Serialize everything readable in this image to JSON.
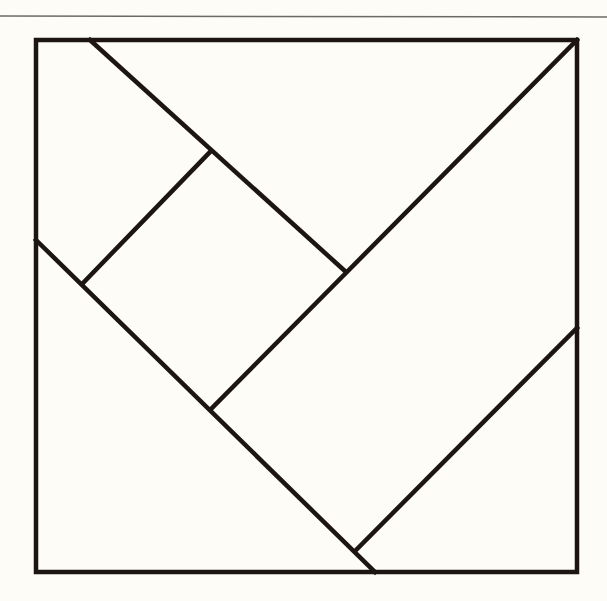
{
  "diagram": {
    "type": "tangram-square-dissection",
    "background_color": "#fdfcf7",
    "stroke_color": "#1c1511",
    "rule_color": "#6b6b66",
    "top_rule": {
      "x1": 0,
      "y1": 16,
      "x2": 607,
      "y2": 17
    },
    "outer_square": {
      "x": 36,
      "y": 40,
      "width": 541,
      "height": 532
    },
    "lines": [
      {
        "name": "upper-diagonal",
        "x1": 90,
        "y1": 40,
        "x2": 346,
        "y2": 272
      },
      {
        "name": "long-diagonal",
        "x1": 577,
        "y1": 40,
        "x2": 212,
        "y2": 408
      },
      {
        "name": "lower-left-diagonal",
        "x1": 36,
        "y1": 240,
        "x2": 375,
        "y2": 572
      },
      {
        "name": "small-square-edge",
        "x1": 83,
        "y1": 283,
        "x2": 210,
        "y2": 152
      },
      {
        "name": "lower-right-diagonal",
        "x1": 356,
        "y1": 550,
        "x2": 577,
        "y2": 328
      }
    ]
  }
}
